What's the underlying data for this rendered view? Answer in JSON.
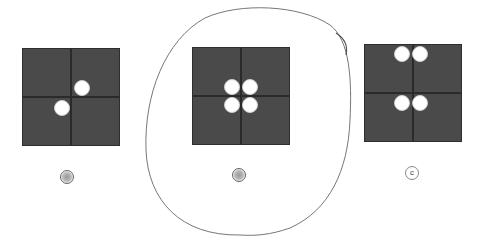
{
  "figure": {
    "options": [
      {
        "label": "a",
        "dots": [
          [
            58,
            37
          ],
          [
            38,
            57
          ]
        ],
        "scribbled": true
      },
      {
        "label": "b",
        "dots": [
          [
            38,
            37
          ],
          [
            58,
            37
          ],
          [
            38,
            57
          ],
          [
            58,
            57
          ]
        ],
        "scribbled": true,
        "circled": true
      },
      {
        "label": "c",
        "dots": [
          [
            38,
            7
          ],
          [
            58,
            7
          ],
          [
            38,
            57
          ],
          [
            58,
            57
          ]
        ],
        "scribbled": false
      }
    ],
    "colors": {
      "panel": "#4a4a4a",
      "grid": "#2a2a2a",
      "dot": "#ffffff"
    }
  }
}
